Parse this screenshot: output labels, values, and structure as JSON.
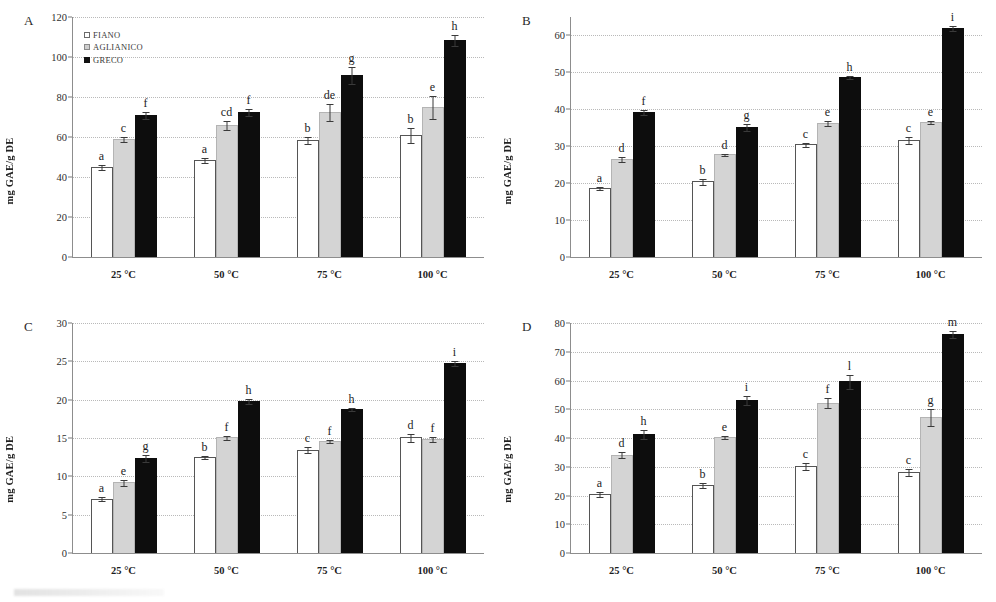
{
  "figure": {
    "legend": {
      "items": [
        {
          "key": "fiano",
          "label": "FIANO"
        },
        {
          "key": "aglianico",
          "label": "AGLIANICO"
        },
        {
          "key": "greco",
          "label": "GRECO"
        }
      ]
    },
    "colors": {
      "fiano": "#ffffff",
      "aglianico": "#d4d4d4",
      "greco": "#0d0d0d",
      "gridline": "#b9b9b9",
      "axis": "#8d8d8d"
    },
    "panels": [
      {
        "label": "A",
        "ylabel": "mg GAE/g DE",
        "ylim": [
          0,
          120
        ],
        "yticks": [
          0,
          20,
          40,
          60,
          80,
          100,
          120
        ],
        "show_legend": true
      },
      {
        "label": "B",
        "ylabel": "mg GAE/g DE",
        "ylim": [
          0,
          65
        ],
        "yticks": [
          0,
          10,
          20,
          30,
          40,
          50,
          60
        ],
        "show_legend": false
      },
      {
        "label": "C",
        "ylabel": "mg GAE/g DE",
        "ylim": [
          0,
          30
        ],
        "yticks": [
          0,
          5,
          10,
          15,
          20,
          25,
          30
        ],
        "show_legend": false
      },
      {
        "label": "D",
        "ylabel": "mg GAE/g DE",
        "ylim": [
          0,
          80
        ],
        "yticks": [
          0,
          10,
          20,
          30,
          40,
          50,
          60,
          70,
          80
        ],
        "show_legend": false
      }
    ]
  },
  "chart_data": [
    {
      "type": "bar",
      "panel": "A",
      "title": "",
      "xlabel": "",
      "ylabel": "mg GAE/g DE",
      "ylim": [
        0,
        120
      ],
      "yticks": [
        0,
        20,
        40,
        60,
        80,
        100,
        120
      ],
      "grid": true,
      "legend_position": "top-left",
      "categories": [
        "25 °C",
        "50 °C",
        "75 °C",
        "100 °C"
      ],
      "series": [
        {
          "name": "FIANO",
          "values": [
            45.0,
            48.3,
            58.5,
            61.0
          ],
          "errors": [
            1.4,
            1.5,
            2.0,
            3.8
          ],
          "labels": [
            "a",
            "a",
            "b",
            "b"
          ]
        },
        {
          "name": "AGLIANICO",
          "values": [
            59.0,
            66.0,
            72.5,
            75.0
          ],
          "errors": [
            1.6,
            2.5,
            4.5,
            6.2
          ],
          "labels": [
            "c",
            "cd",
            "de",
            "e"
          ]
        },
        {
          "name": "GRECO",
          "values": [
            71.0,
            72.5,
            91.0,
            108.5
          ],
          "errors": [
            2.0,
            1.8,
            4.5,
            3.2
          ],
          "labels": [
            "f",
            "f",
            "g",
            "h"
          ]
        }
      ]
    },
    {
      "type": "bar",
      "panel": "B",
      "title": "",
      "xlabel": "",
      "ylabel": "mg GAE/g DE",
      "ylim": [
        0,
        65
      ],
      "yticks": [
        0,
        10,
        20,
        30,
        40,
        50,
        60
      ],
      "grid": true,
      "legend_position": "none",
      "categories": [
        "25 °C",
        "50 °C",
        "75 °C",
        "100 °C"
      ],
      "series": [
        {
          "name": "FIANO",
          "values": [
            18.6,
            20.5,
            30.5,
            31.7
          ],
          "errors": [
            0.5,
            1.0,
            0.6,
            1.1
          ],
          "labels": [
            "a",
            "b",
            "c",
            "c"
          ]
        },
        {
          "name": "AGLIANICO",
          "values": [
            26.5,
            27.8,
            36.2,
            36.5
          ],
          "errors": [
            0.9,
            0.5,
            0.8,
            0.5
          ],
          "labels": [
            "d",
            "d",
            "e",
            "e"
          ]
        },
        {
          "name": "GRECO",
          "values": [
            39.2,
            35.2,
            48.8,
            62.0
          ],
          "errors": [
            0.8,
            1.0,
            0.6,
            0.8
          ],
          "labels": [
            "f",
            "g",
            "h",
            "i"
          ]
        }
      ]
    },
    {
      "type": "bar",
      "panel": "C",
      "title": "",
      "xlabel": "",
      "ylabel": "mg GAE/g DE",
      "ylim": [
        0,
        30
      ],
      "yticks": [
        0,
        5,
        10,
        15,
        20,
        25,
        30
      ],
      "grid": true,
      "legend_position": "none",
      "categories": [
        "25 °C",
        "50 °C",
        "75 °C",
        "100 °C"
      ],
      "series": [
        {
          "name": "FIANO",
          "values": [
            7.1,
            12.5,
            13.5,
            15.1
          ],
          "errors": [
            0.3,
            0.3,
            0.4,
            0.6
          ],
          "labels": [
            "a",
            "b",
            "c",
            "d"
          ]
        },
        {
          "name": "AGLIANICO",
          "values": [
            9.2,
            15.1,
            14.6,
            14.9
          ],
          "errors": [
            0.5,
            0.3,
            0.3,
            0.4
          ],
          "labels": [
            "e",
            "f",
            "f",
            "f"
          ]
        },
        {
          "name": "GRECO",
          "values": [
            12.4,
            19.8,
            18.8,
            24.8
          ],
          "errors": [
            0.5,
            0.4,
            0.3,
            0.4
          ],
          "labels": [
            "g",
            "h",
            "h",
            "i"
          ]
        }
      ]
    },
    {
      "type": "bar",
      "panel": "D",
      "title": "",
      "xlabel": "",
      "ylabel": "mg GAE/g DE",
      "ylim": [
        0,
        80
      ],
      "yticks": [
        0,
        10,
        20,
        30,
        40,
        50,
        60,
        70,
        80
      ],
      "grid": true,
      "legend_position": "none",
      "categories": [
        "25 °C",
        "50 °C",
        "75 °C",
        "100 °C"
      ],
      "series": [
        {
          "name": "FIANO",
          "values": [
            20.6,
            23.7,
            30.2,
            28.3
          ],
          "errors": [
            1.1,
            1.0,
            1.3,
            1.4
          ],
          "labels": [
            "a",
            "b",
            "c",
            "c"
          ]
        },
        {
          "name": "AGLIANICO",
          "values": [
            34.2,
            40.4,
            52.3,
            47.4
          ],
          "errors": [
            1.2,
            0.8,
            2.0,
            3.1
          ],
          "labels": [
            "d",
            "e",
            "f",
            "g"
          ]
        },
        {
          "name": "GRECO",
          "values": [
            41.5,
            53.3,
            59.8,
            76.2
          ],
          "errors": [
            1.8,
            1.7,
            2.6,
            1.5
          ],
          "labels": [
            "h",
            "i",
            "l",
            "m"
          ]
        }
      ]
    }
  ]
}
